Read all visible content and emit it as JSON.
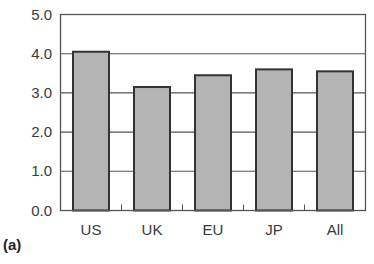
{
  "panel_label": "(a)",
  "chart_data": {
    "type": "bar",
    "title": "",
    "xlabel": "",
    "ylabel": "",
    "categories": [
      "US",
      "UK",
      "EU",
      "JP",
      "All"
    ],
    "values": [
      4.05,
      3.15,
      3.45,
      3.6,
      3.55
    ],
    "ylim": [
      0,
      5
    ],
    "yticks": [
      "0.0",
      "1.0",
      "2.0",
      "3.0",
      "4.0",
      "5.0"
    ],
    "grid": true,
    "legend": null,
    "bar_color": "#b4b4b4",
    "bar_edge_color": "#333333"
  }
}
